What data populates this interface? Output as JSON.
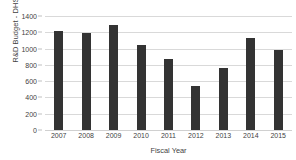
{
  "chart_data": {
    "type": "bar",
    "title": "",
    "xlabel": "Fiscal Year",
    "ylabel": "R&D Budget - DHS",
    "categories": [
      "2007",
      "2008",
      "2009",
      "2010",
      "2011",
      "2012",
      "2013",
      "2014",
      "2015"
    ],
    "values": [
      1215,
      1190,
      1290,
      1040,
      875,
      545,
      760,
      1125,
      985
    ],
    "ylim": [
      0,
      1400
    ],
    "yticks": [
      0,
      200,
      400,
      600,
      800,
      1000,
      1200,
      1400
    ],
    "ytick_labels": [
      "0",
      "200",
      "400",
      "600",
      "800",
      "1000",
      "1200",
      "1400"
    ],
    "grid": true,
    "legend": false,
    "series": [
      {
        "name": "R&D Budget - DHS",
        "values": [
          1215,
          1190,
          1290,
          1040,
          875,
          545,
          760,
          1125,
          985
        ]
      }
    ],
    "colors": {
      "bar": "#333333",
      "gridline": "#d9d9d9",
      "text": "#3f3f3f",
      "background": "#ffffff"
    }
  }
}
